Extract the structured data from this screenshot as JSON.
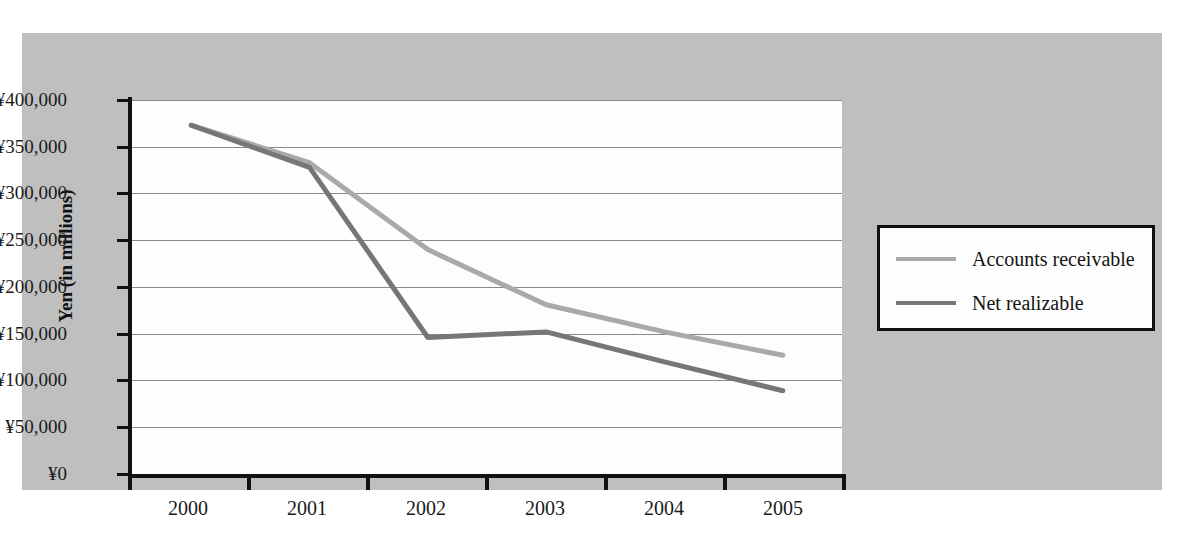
{
  "chart_data": {
    "type": "line",
    "title": "",
    "subtitle": "",
    "xlabel": "",
    "ylabel": "Yen (in millions)",
    "x": [
      "2000",
      "2001",
      "2002",
      "2003",
      "2004",
      "2005"
    ],
    "categories": [
      "2000",
      "2001",
      "2002",
      "2003",
      "2004",
      "2005"
    ],
    "series": [
      {
        "name": "Accounts receivable",
        "color": "#a9a9a9",
        "values": [
          373000,
          333000,
          240000,
          181000,
          152000,
          127000
        ]
      },
      {
        "name": "Net realizable",
        "color": "#767676",
        "values": [
          373000,
          328000,
          146000,
          152000,
          120000,
          89000
        ]
      }
    ],
    "ylim": [
      0,
      400000
    ],
    "ytick_values": [
      400000,
      350000,
      300000,
      250000,
      200000,
      150000,
      100000,
      50000,
      0
    ],
    "ytick_labels": [
      "¥400,000",
      "¥350,000",
      "¥300,000",
      "¥250,000",
      "¥200,000",
      "¥150,000",
      "¥100,000",
      "¥50,000",
      "¥0"
    ],
    "grid": true,
    "grid_axis": "y",
    "legend_position": "right",
    "currency_symbol": "¥"
  },
  "axes": {
    "y_title": "Yen (in millions)",
    "x_tick_labels": [
      "2000",
      "2001",
      "2002",
      "2003",
      "2004",
      "2005"
    ],
    "y_tick_labels": [
      "¥400,000",
      "¥350,000",
      "¥300,000",
      "¥250,000",
      "¥200,000",
      "¥150,000",
      "¥100,000",
      "¥50,000",
      "¥0"
    ]
  },
  "legend": {
    "entries": [
      {
        "label": "Accounts receivable",
        "color": "#a9a9a9"
      },
      {
        "label": "Net realizable",
        "color": "#767676"
      }
    ]
  },
  "colors": {
    "panel_background": "#bfbfbf",
    "plot_background": "#fdfdfd",
    "axis": "#111111",
    "gridline": "#8a8a8a",
    "series_light": "#a9a9a9",
    "series_dark": "#767676"
  }
}
